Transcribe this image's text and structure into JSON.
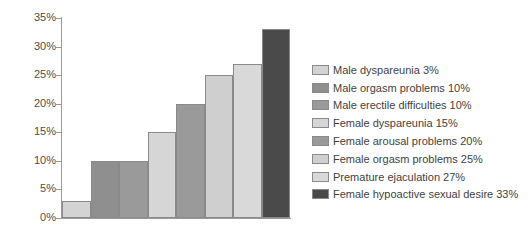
{
  "chart_data": {
    "type": "bar",
    "title": "",
    "xlabel": "",
    "ylabel": "",
    "ylim": [
      0,
      35
    ],
    "grid": false,
    "legend_position": "right",
    "ytick_labels": [
      "35%",
      "30%",
      "25%",
      "20%",
      "15%",
      "10%",
      "5%",
      "0%"
    ],
    "ytick_values": [
      35,
      30,
      25,
      20,
      15,
      10,
      5,
      0
    ],
    "categories": [
      "Male dyspareunia",
      "Male orgasm problems",
      "Male erectile difficulties",
      "Female dyspareunia",
      "Female arousal problems",
      "Female orgasm problems",
      "Premature ejaculation",
      "Female hypoactive sexual desire"
    ],
    "values": [
      3,
      10,
      10,
      15,
      20,
      25,
      27,
      33
    ],
    "value_labels": [
      "3%",
      "10%",
      "10%",
      "15%",
      "20%",
      "25%",
      "27%",
      "33%"
    ],
    "colors": [
      "#d3d3d3",
      "#8f8f8f",
      "#9a9a9a",
      "#d6d6d6",
      "#9a9a9a",
      "#cfcfcf",
      "#d9d9d9",
      "#4a4a4a"
    ],
    "legend_entries": [
      {
        "label": "Male dyspareunia 3%",
        "color": "#d3d3d3"
      },
      {
        "label": "Male orgasm problems 10%",
        "color": "#8f8f8f"
      },
      {
        "label": "Male erectile difficulties 10%",
        "color": "#9a9a9a"
      },
      {
        "label": "Female dyspareunia 15%",
        "color": "#d6d6d6"
      },
      {
        "label": "Female arousal problems 20%",
        "color": "#9a9a9a"
      },
      {
        "label": "Female orgasm problems 25%",
        "color": "#cfcfcf"
      },
      {
        "label": "Premature ejaculation 27%",
        "color": "#d9d9d9"
      },
      {
        "label": "Female hypoactive sexual desire 33%",
        "color": "#4a4a4a"
      }
    ]
  }
}
